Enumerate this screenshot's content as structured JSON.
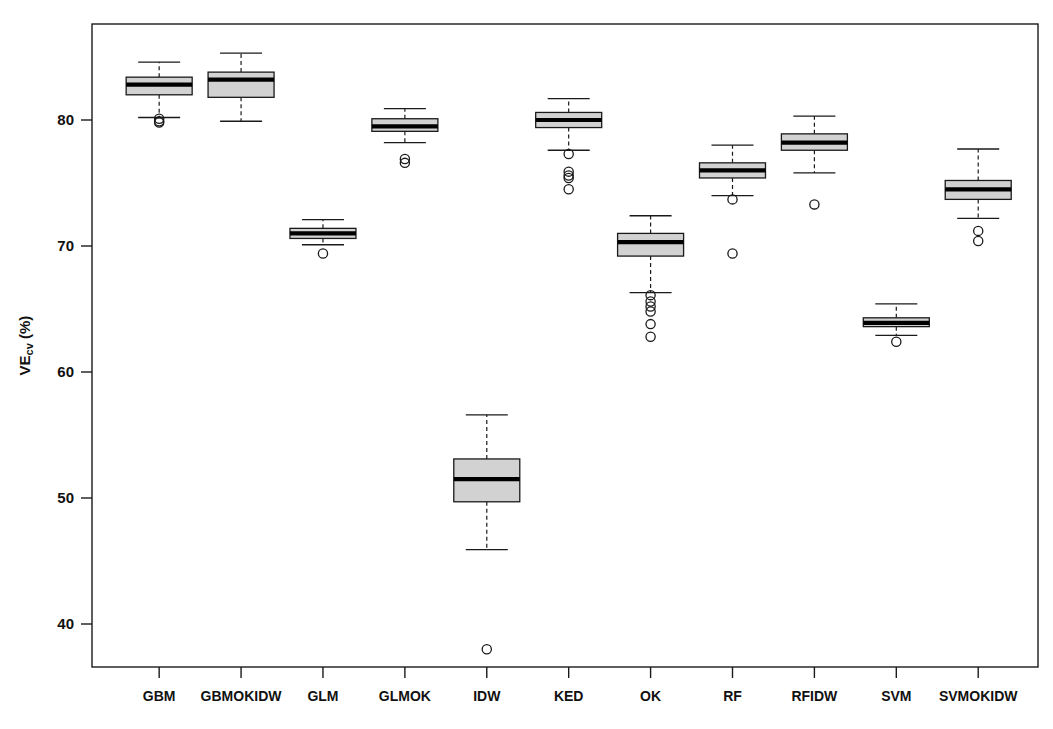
{
  "chart_data": {
    "type": "boxplot",
    "title": "",
    "xlabel": "",
    "ylabel": "VEcv (%)",
    "ylabel_main": "VE",
    "ylabel_sub": "cv",
    "ylabel_unit": " (%)",
    "ylim": [
      36.5,
      87.0
    ],
    "yticks": [
      40,
      50,
      60,
      70,
      80
    ],
    "ytick_labels": [
      "40",
      "50",
      "60",
      "70",
      "80"
    ],
    "grid": false,
    "legend": "none",
    "categories": [
      "GBM",
      "GBMOKIDW",
      "GLM",
      "GLMOK",
      "IDW",
      "KED",
      "OK",
      "RF",
      "RFIDW",
      "SVM",
      "SVMOKIDW"
    ],
    "boxes": [
      {
        "name": "GBM",
        "whisker_low": 80.2,
        "q1": 82.0,
        "median": 82.8,
        "q3": 83.4,
        "whisker_high": 84.6,
        "outliers": [
          80.1,
          79.9,
          79.8
        ]
      },
      {
        "name": "GBMOKIDW",
        "whisker_low": 79.9,
        "q1": 81.8,
        "median": 83.2,
        "q3": 83.8,
        "whisker_high": 85.3,
        "outliers": []
      },
      {
        "name": "GLM",
        "whisker_low": 70.1,
        "q1": 70.6,
        "median": 71.0,
        "q3": 71.4,
        "whisker_high": 72.1,
        "outliers": [
          69.4
        ]
      },
      {
        "name": "GLMOK",
        "whisker_low": 78.2,
        "q1": 79.1,
        "median": 79.5,
        "q3": 80.1,
        "whisker_high": 80.9,
        "outliers": [
          76.9,
          76.6
        ]
      },
      {
        "name": "IDW",
        "whisker_low": 45.9,
        "q1": 49.7,
        "median": 51.5,
        "q3": 53.1,
        "whisker_high": 56.6,
        "outliers": [
          38.0
        ]
      },
      {
        "name": "KED",
        "whisker_low": 77.6,
        "q1": 79.4,
        "median": 80.0,
        "q3": 80.6,
        "whisker_high": 81.7,
        "outliers": [
          77.3,
          75.9,
          75.6,
          75.4,
          74.5
        ]
      },
      {
        "name": "OK",
        "whisker_low": 66.3,
        "q1": 69.2,
        "median": 70.3,
        "q3": 71.0,
        "whisker_high": 72.4,
        "outliers": [
          66.1,
          65.6,
          65.2,
          64.8,
          63.8,
          62.8
        ]
      },
      {
        "name": "RF",
        "whisker_low": 74.0,
        "q1": 75.4,
        "median": 76.0,
        "q3": 76.6,
        "whisker_high": 78.0,
        "outliers": [
          73.7,
          69.4
        ]
      },
      {
        "name": "RFIDW",
        "whisker_low": 75.8,
        "q1": 77.6,
        "median": 78.2,
        "q3": 78.9,
        "whisker_high": 80.3,
        "outliers": [
          73.3
        ]
      },
      {
        "name": "SVM",
        "whisker_low": 62.9,
        "q1": 63.6,
        "median": 63.9,
        "q3": 64.3,
        "whisker_high": 65.4,
        "outliers": [
          62.4
        ]
      },
      {
        "name": "SVMOKIDW",
        "whisker_low": 72.2,
        "q1": 73.7,
        "median": 74.5,
        "q3": 75.2,
        "whisker_high": 77.7,
        "outliers": [
          71.2,
          70.4
        ]
      }
    ],
    "colors": {
      "box_fill": "#d2d2d2",
      "box_stroke": "#1a1a1a",
      "median": "#000000",
      "axis": "#1a1a1a",
      "background": "#ffffff"
    }
  }
}
